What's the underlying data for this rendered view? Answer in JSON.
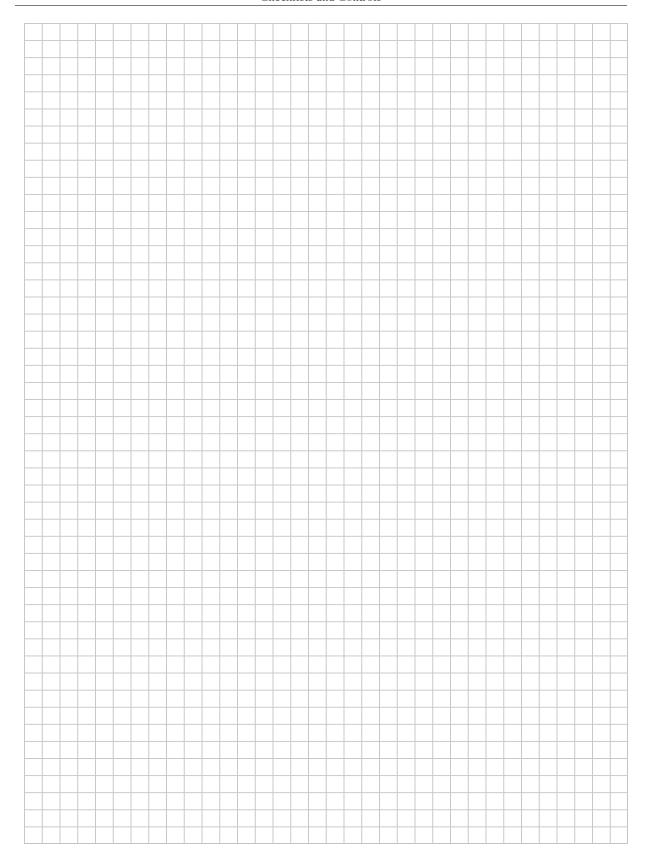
{
  "page": {
    "running_header": "Checklists and Controls"
  },
  "grid": {
    "columns": 34,
    "rows": 48,
    "line_color": "#c8c8c8",
    "rule_color": "#7a7a7a"
  }
}
